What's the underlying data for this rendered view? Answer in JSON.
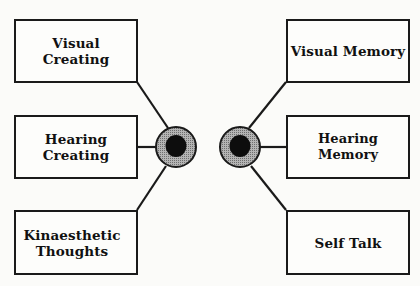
{
  "diagram": {
    "left_group": {
      "boxes": [
        {
          "label": "Visual\nCreating"
        },
        {
          "label": "Hearing\nCreating"
        },
        {
          "label": "Kinaesthetic\nThoughts"
        }
      ],
      "hub": "eye-circle-left"
    },
    "right_group": {
      "boxes": [
        {
          "label": "Visual Memory"
        },
        {
          "label": "Hearing Memory"
        },
        {
          "label": "Self Talk"
        }
      ],
      "hub": "eye-circle-right"
    },
    "colors": {
      "line": "#1a1a1a",
      "ring": "#9a9a9a",
      "pupil": "#0d0d0d",
      "background": "#fbfbf9"
    }
  }
}
